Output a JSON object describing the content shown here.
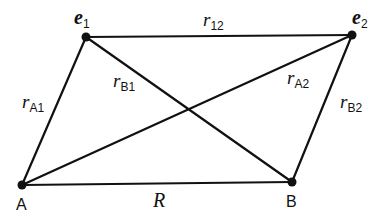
{
  "diagram": {
    "nodes": [
      {
        "id": "e1",
        "label": "e",
        "sub": "1",
        "x": 86,
        "y": 37
      },
      {
        "id": "e2",
        "label": "e",
        "sub": "2",
        "x": 352,
        "y": 35
      },
      {
        "id": "A",
        "label": "A",
        "x": 22,
        "y": 185
      },
      {
        "id": "B",
        "label": "B",
        "x": 292,
        "y": 182
      }
    ],
    "edges": [
      {
        "from": "e1",
        "to": "e2",
        "label": "r",
        "sub": "12"
      },
      {
        "from": "A",
        "to": "e1",
        "label": "r",
        "sub": "A1"
      },
      {
        "from": "B",
        "to": "e1",
        "label": "r",
        "sub": "B1"
      },
      {
        "from": "A",
        "to": "e2",
        "label": "r",
        "sub": "A2"
      },
      {
        "from": "B",
        "to": "e2",
        "label": "r",
        "sub": "B2"
      },
      {
        "from": "A",
        "to": "B",
        "label": "R",
        "sub": ""
      }
    ],
    "labels": {
      "e1": {
        "main": "e",
        "sub": "1"
      },
      "e2": {
        "main": "e",
        "sub": "2"
      },
      "A": "A",
      "B": "B",
      "r12": {
        "main": "r",
        "sub": "12"
      },
      "rA1": {
        "main": "r",
        "sub": "A1"
      },
      "rB1": {
        "main": "r",
        "sub": "B1"
      },
      "rA2": {
        "main": "r",
        "sub": "A2"
      },
      "rB2": {
        "main": "r",
        "sub": "B2"
      },
      "R": "R"
    },
    "colors": {
      "line": "#111111",
      "background": "#ffffff"
    }
  }
}
